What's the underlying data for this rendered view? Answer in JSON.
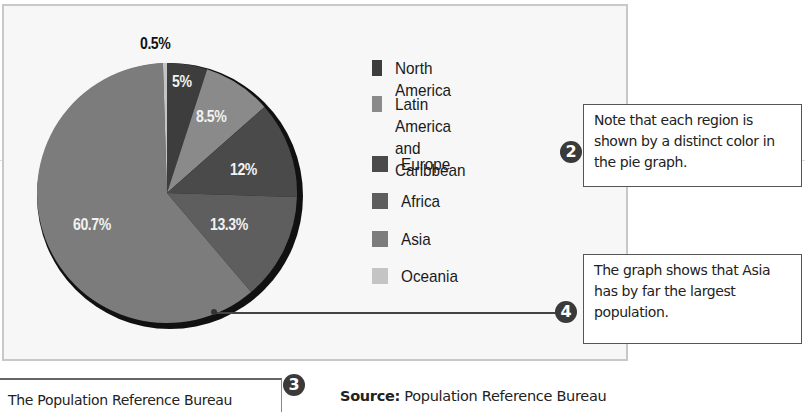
{
  "chart_data": {
    "type": "pie",
    "title": "",
    "categories": [
      "North America",
      "Latin America and Caribbean",
      "Europe",
      "Africa",
      "Asia",
      "Oceania"
    ],
    "values": [
      5,
      8.5,
      12,
      13.3,
      60.7,
      0.5
    ],
    "value_labels": [
      "5%",
      "8.5%",
      "12%",
      "13.3%",
      "60.7%",
      "0.5%"
    ],
    "colors": [
      "#3d3d3d",
      "#8a8a8a",
      "#4a4a4a",
      "#5e5e5e",
      "#7c7c7c",
      "#c4c4c4"
    ],
    "legend_position": "right",
    "unit": "%"
  },
  "labels": {
    "oceania": "0.5%",
    "north_america": "5%",
    "latin_america": "8.5%",
    "europe": "12%",
    "africa": "13.3%",
    "asia": "60.7%"
  },
  "legend": {
    "items": [
      {
        "label": "North America",
        "color": "#3d3d3d"
      },
      {
        "label": "Latin America and\nCaribbean",
        "color": "#8a8a8a"
      },
      {
        "label": "Europe",
        "color": "#4a4a4a"
      },
      {
        "label": "Africa",
        "color": "#5e5e5e"
      },
      {
        "label": "Asia",
        "color": "#7c7c7c"
      },
      {
        "label": "Oceania",
        "color": "#c4c4c4"
      }
    ]
  },
  "callouts": {
    "two": {
      "number": "2",
      "text": "Note that each region is shown by a distinct color in the pie graph."
    },
    "three": {
      "number": "3",
      "text": "The Population Reference Bureau"
    },
    "four": {
      "number": "4",
      "text": "The graph shows that Asia has by far the largest population."
    }
  },
  "source": {
    "prefix": "Source:",
    "text": " Population Reference Bureau"
  }
}
